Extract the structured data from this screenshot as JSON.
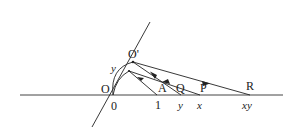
{
  "diagram": {
    "points": {
      "O": {
        "label": "O",
        "coord_label": "0"
      },
      "O_prime": {
        "label": "O'"
      },
      "A": {
        "label": "A",
        "coord_label": "1"
      },
      "Q": {
        "label": "Q",
        "coord_label": "y"
      },
      "P": {
        "label": "P",
        "coord_label": "x"
      },
      "R": {
        "label": "R",
        "coord_label": "xy"
      }
    },
    "arc_label": "y",
    "colors": {
      "stroke": "#222222",
      "background": "#ffffff"
    }
  }
}
